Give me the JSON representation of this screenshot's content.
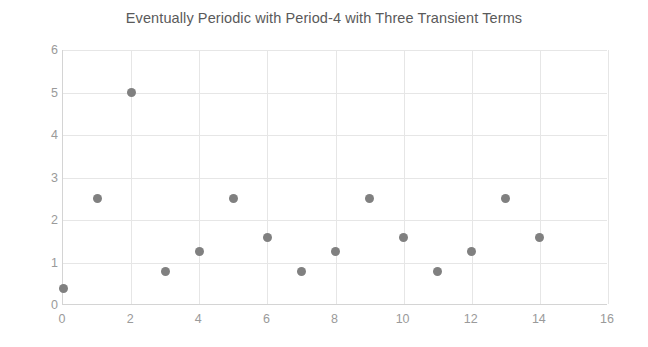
{
  "chart_data": {
    "type": "scatter",
    "title": "Eventually Periodic with Period-4 with Three Transient Terms",
    "xlabel": "",
    "ylabel": "",
    "x": [
      0,
      1,
      2,
      3,
      4,
      5,
      6,
      7,
      8,
      9,
      10,
      11,
      12,
      13,
      14
    ],
    "values": [
      0.4,
      2.5,
      5.0,
      0.8,
      1.25,
      2.5,
      1.6,
      0.8,
      1.25,
      2.5,
      1.6,
      0.8,
      1.25,
      2.5,
      1.6
    ],
    "xlim": [
      0,
      16
    ],
    "ylim": [
      0,
      6
    ],
    "xticks": [
      0,
      2,
      4,
      6,
      8,
      10,
      12,
      14,
      16
    ],
    "yticks": [
      0,
      1,
      2,
      3,
      4,
      5,
      6
    ],
    "xtick_labels": [
      "0",
      "2",
      "4",
      "6",
      "8",
      "10",
      "12",
      "14",
      "16"
    ],
    "ytick_labels": [
      "0",
      "1",
      "2",
      "3",
      "4",
      "5",
      "6"
    ],
    "grid": true,
    "legend": false,
    "marker_color": "#808080",
    "grid_color": "#e6e6e6",
    "axis_color": "#d4d4d4",
    "title_color": "#5a5a5a",
    "tick_color": "#9a9a9a",
    "background": "#ffffff"
  }
}
